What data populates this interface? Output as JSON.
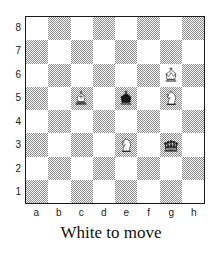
{
  "board": {
    "orientation": "white",
    "light_square_color": "#ffffff",
    "dark_square_color": "#8a8a8a",
    "border_color": "#1a1a1a",
    "files": [
      "a",
      "b",
      "c",
      "d",
      "e",
      "f",
      "g",
      "h"
    ],
    "ranks": [
      "8",
      "7",
      "6",
      "5",
      "4",
      "3",
      "2",
      "1"
    ],
    "pieces": [
      {
        "square": "c5",
        "file": "c",
        "rank": "5",
        "color": "white",
        "type": "bishop",
        "symbol": "♗",
        "name": "white-bishop-c5"
      },
      {
        "square": "e5",
        "file": "e",
        "rank": "5",
        "color": "black",
        "type": "king",
        "symbol": "♚",
        "name": "black-king-e5"
      },
      {
        "square": "g5",
        "file": "g",
        "rank": "5",
        "color": "white",
        "type": "knight",
        "symbol": "♘",
        "name": "white-knight-g5"
      },
      {
        "square": "g6",
        "file": "g",
        "rank": "6",
        "color": "white",
        "type": "king",
        "symbol": "♔",
        "name": "white-king-g6"
      },
      {
        "square": "e3",
        "file": "e",
        "rank": "3",
        "color": "white",
        "type": "knight",
        "symbol": "♘",
        "name": "white-knight-e3"
      },
      {
        "square": "g3",
        "file": "g",
        "rank": "3",
        "color": "black",
        "type": "queen",
        "symbol": "♛",
        "name": "black-queen-g3"
      }
    ],
    "fen": "8/8/6K1/2B1k1N1/8/4N1q1/8/8 w - - 0 1"
  },
  "caption": {
    "text": "White to move"
  }
}
